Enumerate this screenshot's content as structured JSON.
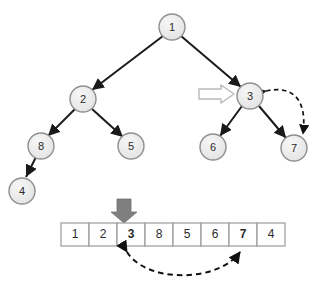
{
  "figure": {
    "colors": {
      "node_fill": "#e9e9e9",
      "node_stroke": "#8f8f8f",
      "edge": "#1a1a1a",
      "text": "#2b2b2b",
      "pointer_arrow": "#7f7f7f",
      "hollow_arrow_fill": "#ffffff",
      "hollow_arrow_stroke": "#b5b5b5",
      "cell_border": "#9a9a9a",
      "cell_fill": "#ffffff",
      "dashed_arrow": "#111111",
      "background": "#ffffff"
    }
  },
  "tree": {
    "nodes": [
      {
        "id": "n1",
        "label": "1",
        "cx": 172,
        "cy": 27,
        "r": 13
      },
      {
        "id": "n2",
        "label": "2",
        "cx": 83,
        "cy": 99,
        "r": 13
      },
      {
        "id": "n3",
        "label": "3",
        "cx": 250,
        "cy": 96,
        "r": 13
      },
      {
        "id": "n8",
        "label": "8",
        "cx": 41,
        "cy": 146,
        "r": 13
      },
      {
        "id": "n5",
        "label": "5",
        "cx": 131,
        "cy": 146,
        "r": 13
      },
      {
        "id": "n6",
        "label": "6",
        "cx": 213,
        "cy": 147,
        "r": 13
      },
      {
        "id": "n7",
        "label": "7",
        "cx": 294,
        "cy": 148,
        "r": 13
      },
      {
        "id": "n4",
        "label": "4",
        "cx": 22,
        "cy": 191,
        "r": 13
      }
    ],
    "edges": [
      {
        "from": "n1",
        "to": "n2"
      },
      {
        "from": "n1",
        "to": "n3"
      },
      {
        "from": "n2",
        "to": "n8"
      },
      {
        "from": "n2",
        "to": "n5"
      },
      {
        "from": "n3",
        "to": "n6"
      },
      {
        "from": "n3",
        "to": "n7"
      },
      {
        "from": "n8",
        "to": "n4"
      }
    ],
    "annotations": {
      "hollow_pointer": {
        "name": "hollow-arrow-pointing-to-node-3",
        "target_label": "3",
        "x_start": 199,
        "x_end": 234,
        "y": 94
      },
      "tree_swap_arc": {
        "name": "dashed-swap-arc-node-3-node-7",
        "from_label": "7",
        "to_label": "3",
        "style": "dashed-double-headed"
      }
    }
  },
  "array": {
    "name": "array-representation",
    "x": 61,
    "y": 223,
    "cell_width": 28,
    "cell_height": 23,
    "cells": [
      {
        "index": 0,
        "value": "1",
        "bold": false
      },
      {
        "index": 1,
        "value": "2",
        "bold": false
      },
      {
        "index": 2,
        "value": "3",
        "bold": true
      },
      {
        "index": 3,
        "value": "8",
        "bold": false
      },
      {
        "index": 4,
        "value": "5",
        "bold": false
      },
      {
        "index": 5,
        "value": "6",
        "bold": false
      },
      {
        "index": 6,
        "value": "7",
        "bold": true
      },
      {
        "index": 7,
        "value": "4",
        "bold": false
      }
    ],
    "annotations": {
      "down_pointer": {
        "name": "gray-down-arrow-pointing-to-cell-3",
        "target_index": 2,
        "target_value": "3",
        "x": 124,
        "y_top": 199,
        "y_tip": 222
      },
      "array_swap_arc": {
        "name": "dashed-swap-arc-cell-3-cell-7",
        "from_index": 2,
        "from_value": "3",
        "to_index": 6,
        "to_value": "7",
        "style": "dashed-double-headed"
      }
    }
  }
}
